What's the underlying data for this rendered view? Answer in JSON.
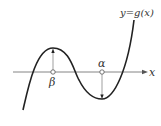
{
  "diagram": {
    "type": "function-graph",
    "curve_label": "y=g(x)",
    "axis_label": "x",
    "points": [
      {
        "name": "beta",
        "label": "β",
        "note": "local maximum x-coordinate"
      },
      {
        "name": "alpha",
        "label": "α",
        "note": "local minimum x-coordinate"
      }
    ],
    "colors": {
      "curve": "#222222",
      "axis": "#555555",
      "text": "#333333"
    }
  }
}
